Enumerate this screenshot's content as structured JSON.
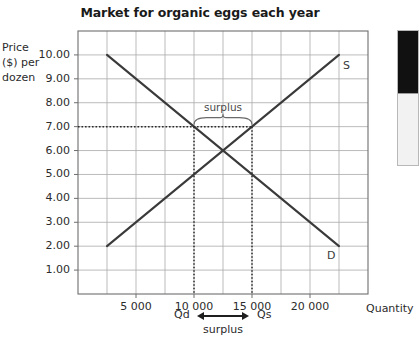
{
  "chart_data": {
    "type": "line",
    "title": "Market for organic eggs each year",
    "xlabel": "Quantity",
    "ylabel": "Price ($) per dozen",
    "ylabel_lines": [
      "Price",
      "($) per",
      "dozen"
    ],
    "xlim": [
      0,
      25000
    ],
    "ylim": [
      0,
      11
    ],
    "grid": true,
    "legend_position": "inline-curve-labels",
    "yticks": [
      10.0,
      9.0,
      8.0,
      7.0,
      6.0,
      5.0,
      4.0,
      3.0,
      2.0,
      1.0
    ],
    "ytick_labels": [
      "10.00",
      "9.00",
      "8.00",
      "7.00",
      "6.00",
      "5.00",
      "4.00",
      "3.00",
      "2.00",
      "1.00"
    ],
    "xticks": [
      5000,
      10000,
      15000,
      20000
    ],
    "xtick_labels": [
      "5 000",
      "10 000",
      "15 000",
      "20 000"
    ],
    "x_minor_step": 2500,
    "series": [
      {
        "name": "D",
        "label": "D",
        "role": "demand",
        "points": [
          [
            2500,
            10.0
          ],
          [
            22500,
            2.0
          ]
        ]
      },
      {
        "name": "S",
        "label": "S",
        "role": "supply",
        "points": [
          [
            2500,
            2.0
          ],
          [
            22500,
            10.0
          ]
        ]
      }
    ],
    "equilibrium": {
      "quantity": 12500,
      "price": 6.0
    },
    "annotations": {
      "price_line": {
        "price": 7.0,
        "style": "dotted",
        "from_q": 0,
        "to_q": 15000
      },
      "qd": {
        "value": 10000,
        "label": "Qd",
        "price": 7.0
      },
      "qs": {
        "value": 15000,
        "label": "Qs",
        "price": 7.0
      },
      "surplus_bracket_label": "surplus",
      "surplus_axis_label": "surplus"
    }
  },
  "labels": {
    "title": "Market for organic eggs each year",
    "y_axis_line1": "Price",
    "y_axis_line2": "($) per",
    "y_axis_line3": "dozen",
    "x_axis": "Quantity",
    "supply_curve": "S",
    "demand_curve": "D",
    "surplus_top": "surplus",
    "qd": "Qd",
    "qs": "Qs",
    "surplus_bottom": "surplus"
  },
  "colors": {
    "curve": "#3a3a3a",
    "grid": "#a9a9a9",
    "axis": "#6e6e6e",
    "text": "#2b2b2b",
    "title": "#1a1a1a",
    "annotation": "#4a4a4a",
    "panel_dark": "#111111",
    "panel_light": "#f2f2f2"
  }
}
